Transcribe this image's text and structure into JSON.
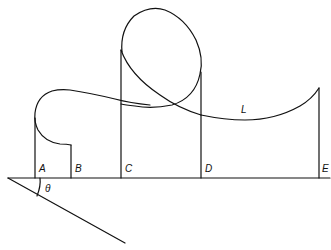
{
  "diagram": {
    "labels": {
      "A": "A",
      "B": "B",
      "C": "C",
      "D": "D",
      "E": "E",
      "L": "L",
      "theta": "θ"
    },
    "stroke_color": "#111111"
  }
}
